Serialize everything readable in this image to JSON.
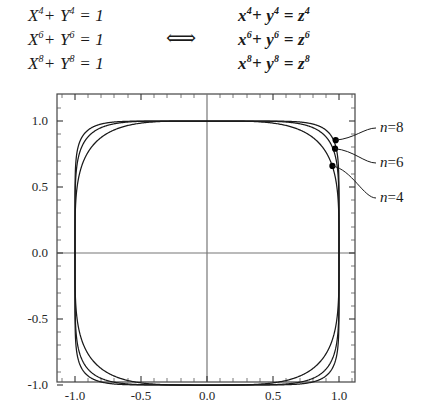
{
  "equations": {
    "left": [
      {
        "base1": "X",
        "exp1": "4",
        "op": "+",
        "base2": "Y",
        "exp2": "4",
        "eq": "=",
        "rhs": "1"
      },
      {
        "base1": "X",
        "exp1": "6",
        "op": "+",
        "base2": "Y",
        "exp2": "6",
        "eq": "=",
        "rhs": "1"
      },
      {
        "base1": "X",
        "exp1": "8",
        "op": "+",
        "base2": "Y",
        "exp2": "8",
        "eq": "=",
        "rhs": "1"
      }
    ],
    "left_text": [
      "X⁴ + Y⁴ = 1",
      "X⁶ + Y⁶ = 1",
      "X⁸ + Y⁸ = 1"
    ],
    "right": [
      {
        "base1": "x",
        "exp1": "4",
        "op": "+",
        "base2": "y",
        "exp2": "4",
        "eq": "=",
        "base3": "z",
        "exp3": "4"
      },
      {
        "base1": "x",
        "exp1": "6",
        "op": "+",
        "base2": "y",
        "exp2": "6",
        "eq": "=",
        "base3": "z",
        "exp3": "6"
      },
      {
        "base1": "x",
        "exp1": "8",
        "op": "+",
        "base2": "y",
        "exp2": "8",
        "eq": "=",
        "base3": "z",
        "exp3": "8"
      }
    ],
    "right_text": [
      "x⁴ + y⁴ = z⁴",
      "x⁶ + y⁶ = z⁶",
      "x⁸ + y⁸ = z⁸"
    ],
    "equivalence_symbol": "⟺"
  },
  "chart_data": {
    "type": "line",
    "title": "",
    "xlabel": "",
    "ylabel": "",
    "xlim": [
      -1.25,
      1.25
    ],
    "ylim": [
      -1.25,
      1.25
    ],
    "xticks": [
      "-1.0",
      "-0.5",
      "0.0",
      "0.5",
      "1.0"
    ],
    "xtick_values": [
      -1.0,
      -0.5,
      0.0,
      0.5,
      1.0
    ],
    "yticks": [
      "1.0",
      "0.5",
      "0.0",
      "-0.5",
      "-1.0"
    ],
    "ytick_values": [
      1.0,
      0.5,
      0.0,
      -0.5,
      -1.0
    ],
    "grid": false,
    "axes_at_zero": true,
    "legend": "inline-annotations",
    "series": [
      {
        "name": "n = 4",
        "equation": "X^4 + Y^4 = 1",
        "n": 4,
        "marker_point": [
          0.95,
          0.66
        ],
        "label": "n = 4"
      },
      {
        "name": "n = 6",
        "equation": "X^6 + Y^6 = 1",
        "n": 6,
        "marker_point": [
          0.97,
          0.79
        ],
        "label": "n = 6"
      },
      {
        "name": "n = 8",
        "equation": "X^8 + Y^8 = 1",
        "n": 8,
        "marker_point": [
          0.975,
          0.855
        ],
        "label": "n = 8"
      }
    ],
    "annotations": [
      {
        "text": "n = 8",
        "n": "n",
        "eq": "=",
        "value": "8"
      },
      {
        "text": "n = 6",
        "n": "n",
        "eq": "=",
        "value": "6"
      },
      {
        "text": "n = 4",
        "n": "n",
        "eq": "=",
        "value": "4"
      }
    ],
    "colors": {
      "curve": "#1a1a1a",
      "axis": "#555555",
      "frame": "#444444",
      "marker": "#000000"
    }
  }
}
